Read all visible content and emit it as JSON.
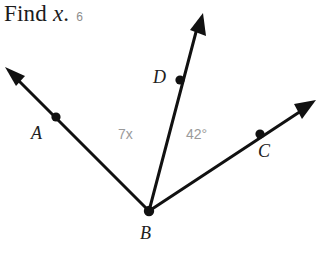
{
  "page": {
    "background_color": "#ffffff"
  },
  "prompt": {
    "find_text": "Find ",
    "variable": "x",
    "period": ".",
    "problem_number": "6"
  },
  "figure": {
    "name": "three-ray-angle-diagram",
    "stroke_color": "#111111",
    "label_color": "#202020",
    "measure_color": "#9a9a9a",
    "vertex": {
      "label": "B",
      "x": 149,
      "y": 211
    },
    "rays": [
      {
        "name": "ray-ba",
        "point_label": "A",
        "point_x": 56,
        "point_y": 117,
        "tip_x": 7,
        "tip_y": 69
      },
      {
        "name": "ray-bd",
        "point_label": "D",
        "point_x": 180,
        "point_y": 80,
        "tip_x": 203,
        "tip_y": 16
      },
      {
        "name": "ray-bc",
        "point_label": "C",
        "point_x": 260,
        "point_y": 134,
        "tip_x": 315,
        "tip_y": 101
      }
    ],
    "labels": {
      "a": "A",
      "b": "B",
      "c": "C",
      "d": "D"
    },
    "angles": [
      {
        "name": "angle-abd",
        "measure": "7x",
        "between": "A and D"
      },
      {
        "name": "angle-dbc",
        "measure": "42°",
        "between": "D and C"
      }
    ]
  }
}
